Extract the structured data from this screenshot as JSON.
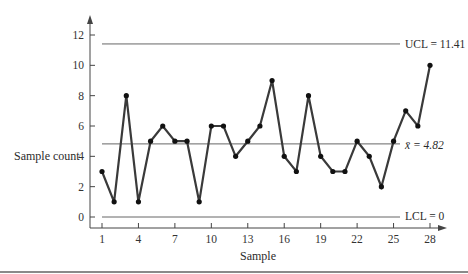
{
  "chart_data": {
    "type": "line",
    "title": "",
    "xlabel": "Sample",
    "ylabel": "Sample count",
    "x": [
      1,
      2,
      3,
      4,
      5,
      6,
      7,
      8,
      9,
      10,
      11,
      12,
      13,
      14,
      15,
      16,
      17,
      18,
      19,
      20,
      21,
      22,
      23,
      24,
      25,
      26,
      27,
      28
    ],
    "series": [
      {
        "name": "Sample count",
        "values": [
          3,
          1,
          8,
          1,
          5,
          6,
          5,
          5,
          1,
          6,
          6,
          4,
          5,
          6,
          9,
          4,
          3,
          8,
          4,
          3,
          3,
          5,
          4,
          2,
          5,
          7,
          6,
          10
        ]
      }
    ],
    "control_lines": [
      {
        "name": "UCL",
        "value": 11.41,
        "label": "UCL = 11.41"
      },
      {
        "name": "center",
        "value": 4.82,
        "label": "x̄ = 4.82"
      },
      {
        "name": "LCL",
        "value": 0,
        "label": "LCL = 0"
      }
    ],
    "xticks": [
      1,
      4,
      7,
      10,
      13,
      16,
      19,
      22,
      25,
      28
    ],
    "yticks": [
      0,
      2,
      4,
      6,
      8,
      10,
      12
    ],
    "xlim": [
      1,
      28
    ],
    "ylim": [
      -1,
      13
    ],
    "grid": false,
    "legend": "none"
  },
  "colors": {
    "line": "#3a3a3a",
    "marker": "#111111",
    "axis": "#444444",
    "control_line": "#666666"
  }
}
